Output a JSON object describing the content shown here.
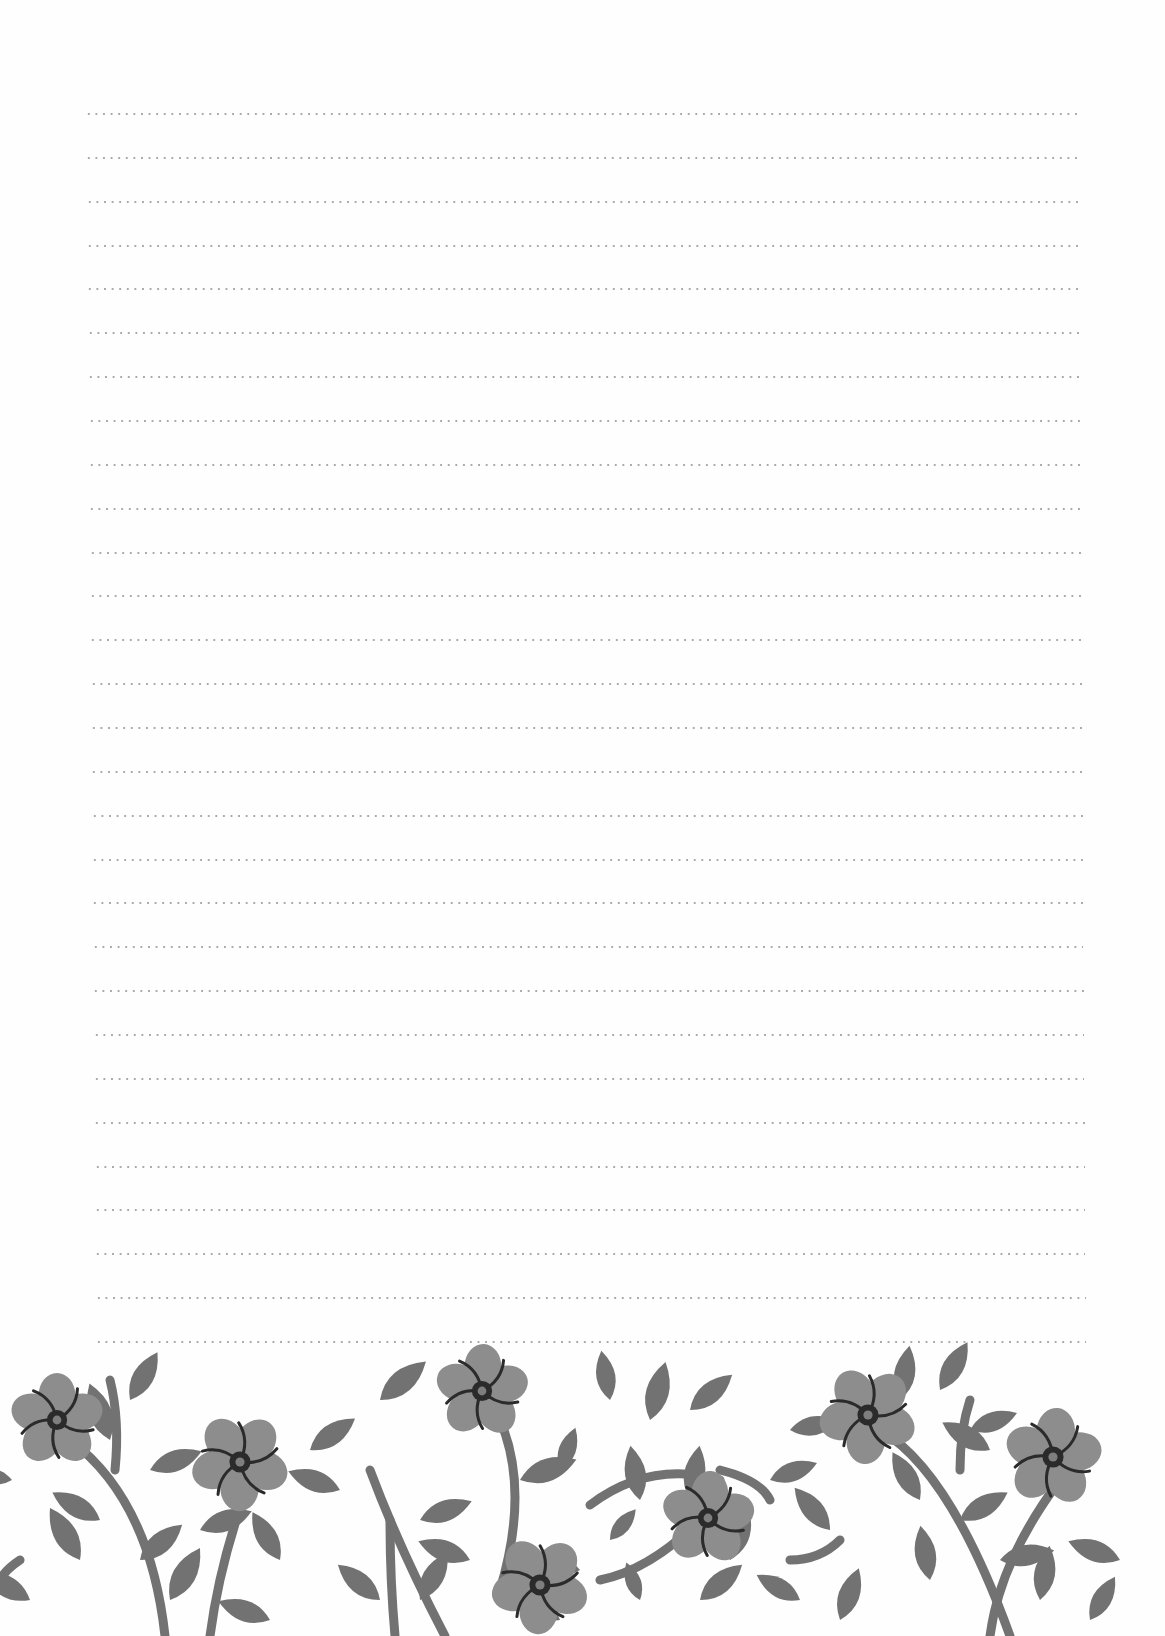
{
  "page": {
    "type": "lined-stationery",
    "background_color": "#fefefe",
    "writing_lines": {
      "count": 29,
      "style": "dotted",
      "dot_color": "#a9a9a9",
      "first_line_y": 114,
      "last_line_y": 1342,
      "left_start_top": 85,
      "left_start_bottom": 95,
      "right_end_top": 1078,
      "right_end_bottom": 1086
    },
    "floral_border": {
      "position": "bottom",
      "leaf_color": "#727272",
      "petal_color": "#8d8d8d",
      "center_color": "#2b2b2b",
      "center_inner_color": "#7e7e7e",
      "stamen_color": "#2b2b2b",
      "flowers": [
        {
          "x": 57,
          "y": 1420,
          "r": 44
        },
        {
          "x": 240,
          "y": 1462,
          "r": 46
        },
        {
          "x": 482,
          "y": 1391,
          "r": 44
        },
        {
          "x": 540,
          "y": 1585,
          "r": 46
        },
        {
          "x": 708,
          "y": 1518,
          "r": 44
        },
        {
          "x": 868,
          "y": 1415,
          "r": 46
        },
        {
          "x": 1053,
          "y": 1457,
          "r": 46
        }
      ]
    }
  }
}
